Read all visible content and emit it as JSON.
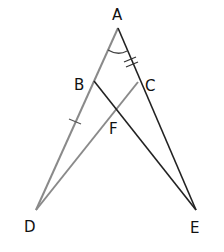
{
  "diagram": {
    "type": "geometry",
    "points": {
      "A": {
        "label": "A",
        "x": 118,
        "y": 28
      },
      "B": {
        "label": "B",
        "x": 94,
        "y": 81
      },
      "C": {
        "label": "C",
        "x": 138,
        "y": 82
      },
      "D": {
        "label": "D",
        "x": 36,
        "y": 210
      },
      "E": {
        "label": "E",
        "x": 196,
        "y": 210
      },
      "F": {
        "label": "F",
        "x": 117,
        "y": 108
      }
    },
    "segments": [
      {
        "from": "A",
        "to": "D",
        "color": "#8a8a8a"
      },
      {
        "from": "C",
        "to": "D",
        "color": "#8a8a8a"
      },
      {
        "from": "A",
        "to": "E",
        "color": "#222222"
      },
      {
        "from": "B",
        "to": "E",
        "color": "#222222"
      }
    ],
    "markings": {
      "angle_arc": "A",
      "double_tick": "AC",
      "single_tick": "BD"
    },
    "labels": {
      "A": "A",
      "B": "B",
      "C": "C",
      "D": "D",
      "E": "E",
      "F": "F"
    }
  }
}
